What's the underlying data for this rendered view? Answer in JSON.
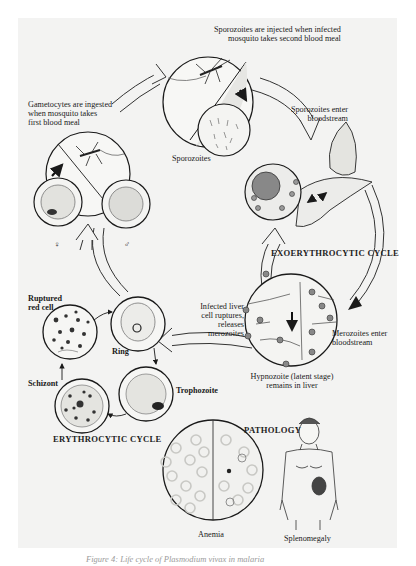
{
  "figure": {
    "caption_visible_fragment": "Figure 4: Life cycle of Plasmodium vivax in malaria"
  },
  "labels": {
    "sporozoites_injected": [
      "Sporozoites are injected when infected",
      "mosquito takes second blood meal"
    ],
    "gametocytes_ingested": [
      "Gametocytes are ingested",
      "when mosquito takes",
      "first blood meal"
    ],
    "sporozoites": "Sporozoites",
    "sporozoites_enter": [
      "Sporozoites enter",
      "bloodstream"
    ],
    "female_symbol": "♀",
    "male_symbol": "♂",
    "exoerythrocytic_cycle": "EXOERYTHROCYTIC CYCLE",
    "infected_liver": [
      "Infected liver",
      "cell ruptures,",
      "releases",
      "merozoites"
    ],
    "merozoites_enter": [
      "Merozoites enter",
      "bloodstream"
    ],
    "hypnozoite": [
      "Hypnozoite (latent stage)",
      "remains in liver"
    ],
    "ruptured_red_cell": [
      "Ruptured",
      "red cell"
    ],
    "ring": "Ring",
    "schizont": "Schizont",
    "trophozoite": "Trophozoite",
    "erythrocytic_cycle": "ERYTHROCYTIC CYCLE",
    "pathology": "PATHOLOGY",
    "anemia": "Anemia",
    "splenomegaly": "Splenomegaly"
  },
  "colors": {
    "panel": "#f3f3f2",
    "ink": "#1a1a1a",
    "cell_fill": "#e9e9e6",
    "stipple": "#555555"
  }
}
